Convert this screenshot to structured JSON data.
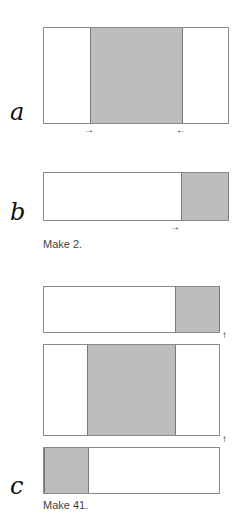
{
  "figures": {
    "a": {
      "label": "a",
      "arrow_left": "→",
      "arrow_right": "←"
    },
    "b": {
      "label": "b",
      "arrow": "→",
      "caption": "Make 2."
    },
    "c": {
      "label": "c",
      "arrow_up_1": "↑",
      "arrow_up_2": "↑",
      "caption": "Make 41."
    }
  },
  "colors": {
    "shade": "#bdbdbd",
    "border": "#8a8a8a"
  }
}
